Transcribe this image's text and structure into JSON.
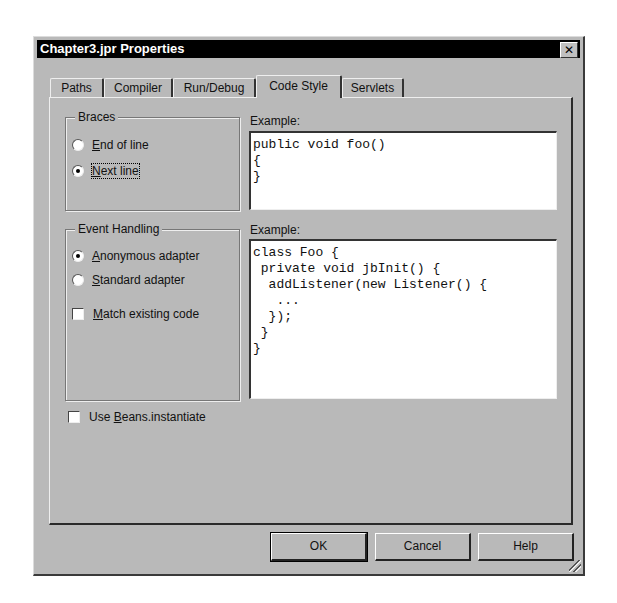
{
  "window": {
    "title": "Chapter3.jpr Properties",
    "close_glyph": "✕"
  },
  "tabs": [
    {
      "label": "Paths",
      "active": false
    },
    {
      "label": "Compiler",
      "active": false
    },
    {
      "label": "Run/Debug",
      "active": false
    },
    {
      "label": "Code Style",
      "active": true
    },
    {
      "label": "Servlets",
      "active": false
    }
  ],
  "braces": {
    "title": "Braces",
    "options": [
      {
        "mnemonic": "E",
        "rest": "nd of line",
        "selected": false
      },
      {
        "mnemonic": "N",
        "rest": "ext line",
        "selected": true
      }
    ],
    "example_label": "Example:",
    "example_code": "public void foo()\n{\n}"
  },
  "event_handling": {
    "title": "Event Handling",
    "options": [
      {
        "mnemonic": "A",
        "rest": "nonymous adapter",
        "selected": true
      },
      {
        "mnemonic": "S",
        "rest": "tandard adapter",
        "selected": false
      }
    ],
    "match_existing": {
      "mnemonic": "M",
      "rest": "atch existing code",
      "checked": false
    },
    "example_label": "Example:",
    "example_code": "class Foo {\n private void jbInit() {\n  addListener(new Listener() {\n   ...\n  });\n }\n}"
  },
  "use_beans": {
    "prefix": "Use ",
    "mnemonic": "B",
    "rest": "eans.instantiate",
    "checked": false
  },
  "buttons": {
    "ok": "OK",
    "cancel": "Cancel",
    "help": "Help"
  }
}
